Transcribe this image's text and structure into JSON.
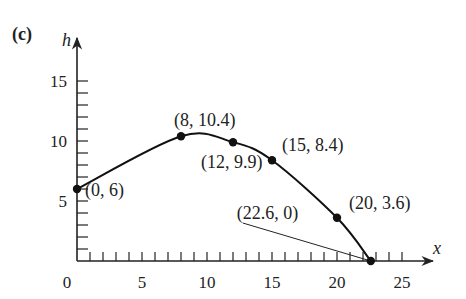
{
  "panel_label": "(c)",
  "chart_data": {
    "type": "line",
    "title": "",
    "xlabel": "x",
    "ylabel": "h",
    "xlim": [
      0,
      27
    ],
    "ylim": [
      0,
      18
    ],
    "x_ticks": [
      0,
      5,
      10,
      15,
      20,
      25
    ],
    "y_ticks": [
      5,
      10,
      15
    ],
    "x_tick_labels": [
      "0",
      "5",
      "10",
      "15",
      "20",
      "25"
    ],
    "y_tick_labels": [
      "5",
      "10",
      "15"
    ],
    "minor_tick_step": 1,
    "grid": false,
    "legend": null,
    "series": [
      {
        "name": "trajectory",
        "points": [
          {
            "x": 0,
            "y": 6,
            "label": "(0, 6)"
          },
          {
            "x": 8,
            "y": 10.4,
            "label": "(8, 10.4)"
          },
          {
            "x": 12,
            "y": 9.9,
            "label": "(12, 9.9)"
          },
          {
            "x": 15,
            "y": 8.4,
            "label": "(15, 8.4)"
          },
          {
            "x": 20,
            "y": 3.6,
            "label": "(20, 3.6)"
          },
          {
            "x": 22.6,
            "y": 0,
            "label": "(22.6, 0)"
          }
        ]
      }
    ],
    "annotations": [
      {
        "text": "(22.6, 0)",
        "leader_line_to": [
          22.6,
          0
        ]
      }
    ]
  }
}
